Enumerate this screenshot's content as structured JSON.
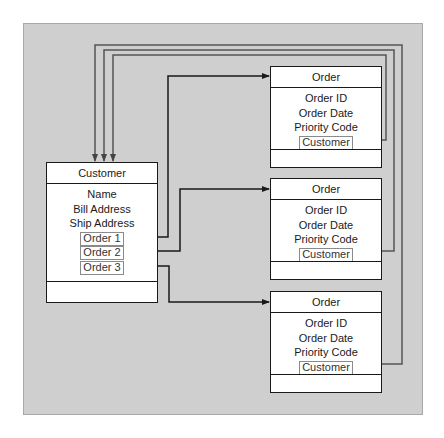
{
  "customer": {
    "title": "Customer",
    "fields": [
      "Name",
      "Bill Address",
      "Ship Address"
    ],
    "refs": [
      "Order 1",
      "Order 2",
      "Order 3"
    ]
  },
  "orders": [
    {
      "title": "Order",
      "fields": [
        "Order ID",
        "Order Date",
        "Priority Code"
      ],
      "ref": "Customer"
    },
    {
      "title": "Order",
      "fields": [
        "Order ID",
        "Order Date",
        "Priority Code"
      ],
      "ref": "Customer"
    },
    {
      "title": "Order",
      "fields": [
        "Order ID",
        "Order Date",
        "Priority Code"
      ],
      "ref": "Customer"
    }
  ],
  "colors": {
    "panel": "#cfcfcf",
    "line": "#1a1a1a",
    "back_line": "#555555"
  }
}
